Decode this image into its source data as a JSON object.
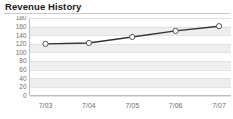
{
  "panel": {
    "title": "Revenue History"
  },
  "chart_data": {
    "type": "line",
    "title": "Revenue History",
    "xlabel": "",
    "ylabel": "",
    "categories": [
      "7/03",
      "7/04",
      "7/05",
      "7/06",
      "7/07"
    ],
    "values": [
      120,
      122,
      136,
      150,
      161
    ],
    "series": [
      {
        "name": "Revenue",
        "values": [
          120,
          122,
          136,
          150,
          161
        ]
      }
    ],
    "ylim": [
      0,
      180
    ],
    "ytick_labels": [
      "180",
      "160",
      "140",
      "120",
      "100",
      "80",
      "60",
      "40",
      "20",
      "0"
    ],
    "ytick_values": [
      180,
      160,
      140,
      120,
      100,
      80,
      60,
      40,
      20,
      0
    ],
    "xtick_labels": [
      "7/03",
      "7/04",
      "7/05",
      "7/06",
      "7/07"
    ],
    "grid": true,
    "grid_style": "horizontal-bands",
    "legend": false,
    "legend_position": "none",
    "marker": "circle-open",
    "colors": {
      "line": "#333333",
      "marker_fill": "#ffffff",
      "marker_stroke": "#555555",
      "band": "#eeeeee",
      "background": "#ffffff",
      "axis": "#bbbbbb",
      "tick_text": "#6e6e6e",
      "title_text": "#1a1a1a",
      "rule": "#c9c9c9"
    }
  }
}
